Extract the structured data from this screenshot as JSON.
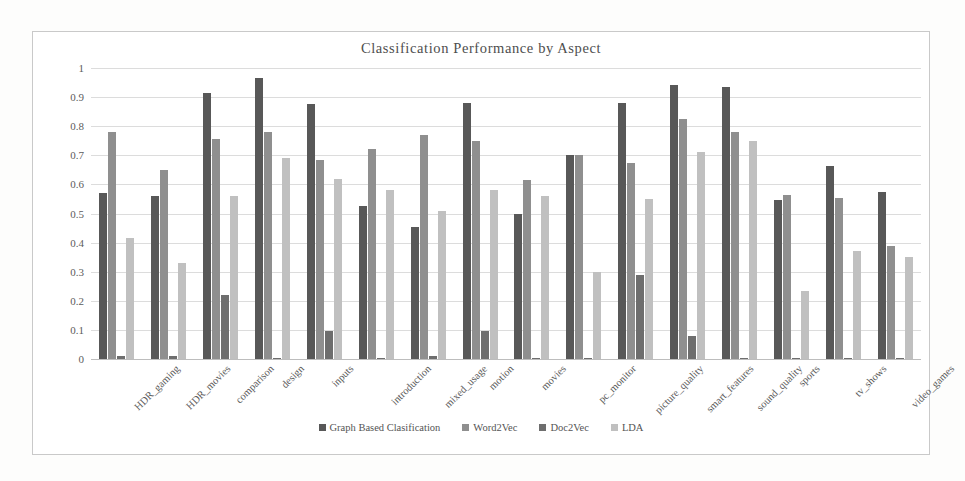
{
  "chart_data": {
    "type": "bar",
    "title": "Classification  Performance  by  Aspect",
    "xlabel": "",
    "ylabel": "",
    "ylim": [
      0,
      1
    ],
    "ytick_labels": [
      "1",
      "0.9",
      "0.8",
      "0.7",
      "0.6",
      "0.5",
      "0.4",
      "0.3",
      "0.2",
      "0.1",
      "0"
    ],
    "ytick_values": [
      1,
      0.9,
      0.8,
      0.7,
      0.6,
      0.5,
      0.4,
      0.3,
      0.2,
      0.1,
      0
    ],
    "grid": true,
    "legend_position": "bottom",
    "categories": [
      "HDR_gaming",
      "HDR_movies",
      "comparison",
      "design",
      "inputs",
      "introduction",
      "mixed_usage",
      "motion",
      "movies",
      "pc_monitor",
      "picture_quality",
      "smart_features",
      "sound_quality",
      "sports",
      "tv_shows",
      "video_games"
    ],
    "series": [
      {
        "name": "Graph Based Clasification",
        "color": "#585858",
        "values": [
          0.57,
          0.56,
          0.915,
          0.965,
          0.875,
          0.525,
          0.455,
          0.88,
          0.5,
          0.7,
          0.88,
          0.94,
          0.935,
          0.545,
          0.665,
          0.575
        ]
      },
      {
        "name": "Word2Vec",
        "color": "#8f8f8f",
        "values": [
          0.78,
          0.65,
          0.755,
          0.78,
          0.685,
          0.72,
          0.77,
          0.75,
          0.615,
          0.7,
          0.675,
          0.825,
          0.78,
          0.565,
          0.555,
          0.39
        ]
      },
      {
        "name": "Doc2Vec",
        "color": "#6e6e6e",
        "values": [
          0.01,
          0.01,
          0.22,
          0.005,
          0.095,
          0.005,
          0.01,
          0.095,
          0.005,
          0.005,
          0.29,
          0.08,
          0.005,
          0.005,
          0.005,
          0.005
        ]
      },
      {
        "name": "LDA",
        "color": "#c0c0c0",
        "values": [
          0.415,
          0.33,
          0.56,
          0.69,
          0.62,
          0.58,
          0.51,
          0.58,
          0.56,
          0.3,
          0.55,
          0.71,
          0.75,
          0.235,
          0.37,
          0.35
        ]
      }
    ]
  }
}
